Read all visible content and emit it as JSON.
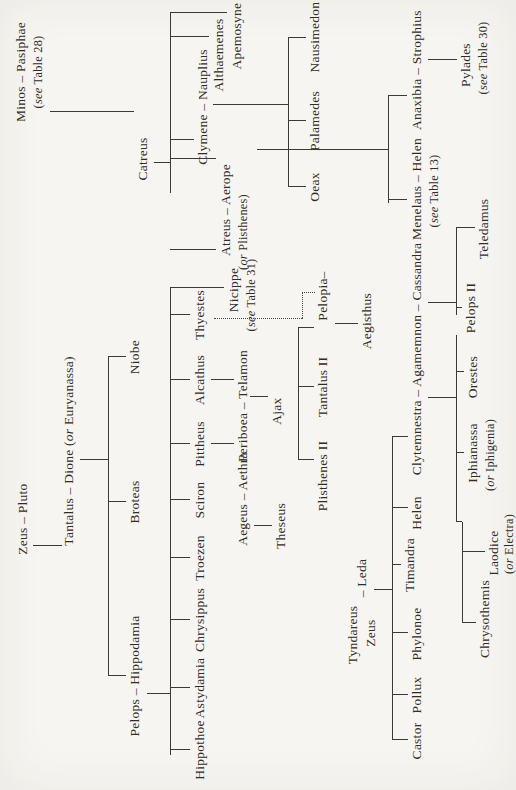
{
  "page": {
    "background": "#f6f5f1",
    "ink_color": "#2e2c29",
    "line_color": "#3b3a37"
  },
  "tree": {
    "nodes": [
      {
        "id": "zeus-pluto",
        "x": 271,
        "y": 16,
        "parts": [
          {
            "t": "Zeus – Pluto",
            "i": false
          }
        ]
      },
      {
        "id": "tantalus-dione",
        "x": 339,
        "y": 62,
        "parts": [
          {
            "t": "Tantalus – Dione (",
            "i": false
          },
          {
            "t": "or",
            "i": true
          },
          {
            "t": " Euryanassa)",
            "i": false
          }
        ]
      },
      {
        "id": "pelops-hippodamia",
        "x": 114,
        "y": 128,
        "parts": [
          {
            "t": "Pelops – Hippodamia",
            "i": false
          }
        ]
      },
      {
        "id": "broteas",
        "x": 288,
        "y": 128,
        "parts": [
          {
            "t": "Broteas",
            "i": false
          }
        ]
      },
      {
        "id": "niobe",
        "x": 433,
        "y": 128,
        "parts": [
          {
            "t": "Niobe",
            "i": false
          }
        ]
      },
      {
        "id": "hippothoe",
        "x": 40,
        "y": 193,
        "parts": [
          {
            "t": "Hippothoe",
            "i": false
          }
        ]
      },
      {
        "id": "astydamia",
        "x": 102,
        "y": 193,
        "parts": [
          {
            "t": "Astydamia",
            "i": false
          }
        ]
      },
      {
        "id": "chrysippus",
        "x": 170,
        "y": 193,
        "parts": [
          {
            "t": "Chrysippus",
            "i": false
          }
        ]
      },
      {
        "id": "troezen",
        "x": 232,
        "y": 193,
        "parts": [
          {
            "t": "Troezen",
            "i": false
          }
        ]
      },
      {
        "id": "sciron",
        "x": 290,
        "y": 193,
        "parts": [
          {
            "t": "Sciron",
            "i": false
          }
        ]
      },
      {
        "id": "pittheus",
        "x": 346,
        "y": 193,
        "parts": [
          {
            "t": "Pittheus",
            "i": false
          }
        ]
      },
      {
        "id": "alcathus",
        "x": 410,
        "y": 193,
        "parts": [
          {
            "t": "Alcathus",
            "i": false
          }
        ]
      },
      {
        "id": "thyestes",
        "x": 475,
        "y": 193,
        "parts": [
          {
            "t": "Thyestes",
            "i": false
          }
        ]
      },
      {
        "id": "aegeus-aethra",
        "x": 291,
        "y": 236,
        "parts": [
          {
            "t": "Aegeus – Aethra",
            "i": false
          }
        ]
      },
      {
        "id": "periboea-telamon",
        "x": 384,
        "y": 236,
        "parts": [
          {
            "t": "Periboea – Telamon",
            "i": false
          }
        ]
      },
      {
        "id": "theseus",
        "x": 264,
        "y": 274,
        "parts": [
          {
            "t": "Theseus",
            "i": false
          }
        ]
      },
      {
        "id": "ajax",
        "x": 379,
        "y": 270,
        "parts": [
          {
            "t": "Ajax",
            "i": false
          }
        ]
      },
      {
        "id": "plisthenes-ii",
        "x": 314,
        "y": 316,
        "parts": [
          {
            "t": "Plisthenes II",
            "i": false
          }
        ]
      },
      {
        "id": "tantalus-ii",
        "x": 403,
        "y": 316,
        "parts": [
          {
            "t": "Tantalus II",
            "i": false
          }
        ]
      },
      {
        "id": "pelopia",
        "x": 494,
        "y": 316,
        "parts": [
          {
            "t": "Pelopia–",
            "i": false
          }
        ]
      },
      {
        "id": "aegisthus",
        "x": 469,
        "y": 360,
        "parts": [
          {
            "t": "Aegisthus",
            "i": false
          }
        ]
      },
      {
        "id": "atreus-aerope",
        "x": 580,
        "y": 219,
        "parts": [
          {
            "t": "Atreus – Aerope",
            "i": false
          }
        ]
      },
      {
        "id": "atreus-aerope-note",
        "x": 558,
        "y": 237,
        "small": true,
        "parts": [
          {
            "t": "(",
            "i": false
          },
          {
            "t": "or",
            "i": true
          },
          {
            "t": " Plisthenes)",
            "i": false
          }
        ]
      },
      {
        "id": "nicippe",
        "x": 500,
        "y": 227,
        "parts": [
          {
            "t": "Nicippe",
            "i": false
          }
        ]
      },
      {
        "id": "nicippe-note",
        "x": 495,
        "y": 245,
        "small": true,
        "parts": [
          {
            "t": "(",
            "i": false
          },
          {
            "t": "see",
            "i": true
          },
          {
            "t": " Table 31)",
            "i": false
          }
        ]
      },
      {
        "id": "minos-pasiphae",
        "x": 718,
        "y": 14,
        "parts": [
          {
            "t": "Minos – Pasiphae",
            "i": false
          }
        ]
      },
      {
        "id": "minos-note",
        "x": 718,
        "y": 32,
        "small": true,
        "parts": [
          {
            "t": "(",
            "i": false
          },
          {
            "t": "see",
            "i": true
          },
          {
            "t": " Table 28)",
            "i": false
          }
        ]
      },
      {
        "id": "catreus",
        "x": 631,
        "y": 136,
        "parts": [
          {
            "t": "Catreus",
            "i": false
          }
        ]
      },
      {
        "id": "clymene-nauplius",
        "x": 683,
        "y": 196,
        "parts": [
          {
            "t": "Clymene – Nauplius",
            "i": false
          }
        ]
      },
      {
        "id": "althaemenes",
        "x": 735,
        "y": 212,
        "parts": [
          {
            "t": "Althaemenes",
            "i": false
          }
        ]
      },
      {
        "id": "apemosyne",
        "x": 754,
        "y": 230,
        "parts": [
          {
            "t": "Apemosyne",
            "i": false
          }
        ]
      },
      {
        "id": "oeax",
        "x": 603,
        "y": 308,
        "parts": [
          {
            "t": "Oeax",
            "i": false
          }
        ]
      },
      {
        "id": "palamedes",
        "x": 669,
        "y": 308,
        "parts": [
          {
            "t": "Palamedes",
            "i": false
          }
        ]
      },
      {
        "id": "nausimedon",
        "x": 753,
        "y": 308,
        "parts": [
          {
            "t": "Nausimedon",
            "i": false
          }
        ]
      },
      {
        "id": "tyndareus",
        "x": 155,
        "y": 346,
        "parts": [
          {
            "t": "Tyndareus",
            "i": false
          }
        ]
      },
      {
        "id": "zeus-2",
        "x": 157,
        "y": 364,
        "parts": [
          {
            "t": "Zeus",
            "i": false
          }
        ]
      },
      {
        "id": "leda",
        "x": 212,
        "y": 355,
        "parts": [
          {
            "t": "– Leda",
            "i": false
          }
        ]
      },
      {
        "id": "castor",
        "x": 49,
        "y": 410,
        "parts": [
          {
            "t": "Castor",
            "i": false
          }
        ]
      },
      {
        "id": "pollux",
        "x": 95,
        "y": 410,
        "parts": [
          {
            "t": "Pollux",
            "i": false
          }
        ]
      },
      {
        "id": "phylonoe",
        "x": 156,
        "y": 410,
        "parts": [
          {
            "t": "Phylonoe",
            "i": false
          }
        ]
      },
      {
        "id": "timandra",
        "x": 225,
        "y": 403,
        "parts": [
          {
            "t": "Timandra",
            "i": false
          }
        ]
      },
      {
        "id": "helen",
        "x": 277,
        "y": 410,
        "parts": [
          {
            "t": "Helen",
            "i": false
          }
        ]
      },
      {
        "id": "clytemnestra-agamemnon-cassandra",
        "x": 431,
        "y": 410,
        "parts": [
          {
            "t": "Clytemnestra – Agamemnon – Cassandra",
            "i": false
          }
        ]
      },
      {
        "id": "menelaus-helen",
        "x": 601,
        "y": 410,
        "parts": [
          {
            "t": "Menelaus – Helen",
            "i": false
          }
        ]
      },
      {
        "id": "menelaus-note",
        "x": 599,
        "y": 428,
        "small": true,
        "parts": [
          {
            "t": "(",
            "i": false
          },
          {
            "t": "see",
            "i": true
          },
          {
            "t": " Table 13)",
            "i": false
          }
        ]
      },
      {
        "id": "anaxibia-strophius",
        "x": 720,
        "y": 410,
        "parts": [
          {
            "t": "Anaxibia – Strophius",
            "i": false
          }
        ]
      },
      {
        "id": "pylades",
        "x": 725,
        "y": 459,
        "parts": [
          {
            "t": "Pylades",
            "i": false
          }
        ]
      },
      {
        "id": "pylades-note",
        "x": 732,
        "y": 477,
        "small": true,
        "parts": [
          {
            "t": "(",
            "i": false
          },
          {
            "t": "see",
            "i": true
          },
          {
            "t": " Table 30)",
            "i": false
          }
        ]
      },
      {
        "id": "orestes",
        "x": 413,
        "y": 466,
        "parts": [
          {
            "t": "Orestes",
            "i": false
          }
        ]
      },
      {
        "id": "iphianassa",
        "x": 337,
        "y": 466,
        "parts": [
          {
            "t": "Iphianassa",
            "i": false
          }
        ]
      },
      {
        "id": "iphianassa-note",
        "x": 335,
        "y": 484,
        "small": true,
        "parts": [
          {
            "t": "(",
            "i": false
          },
          {
            "t": "or",
            "i": true
          },
          {
            "t": " Iphigenia)",
            "i": false
          }
        ]
      },
      {
        "id": "laodice",
        "x": 237,
        "y": 487,
        "parts": [
          {
            "t": "Laodice",
            "i": false
          }
        ]
      },
      {
        "id": "laodice-note",
        "x": 246,
        "y": 503,
        "small": true,
        "parts": [
          {
            "t": "(",
            "i": false
          },
          {
            "t": "or",
            "i": true
          },
          {
            "t": " Electra)",
            "i": false
          }
        ]
      },
      {
        "id": "chrysothemis",
        "x": 171,
        "y": 478,
        "parts": [
          {
            "t": "Chrysothemis",
            "i": false
          }
        ]
      },
      {
        "id": "pelops-ii",
        "x": 482,
        "y": 464,
        "parts": [
          {
            "t": "Pelops II",
            "i": false
          }
        ]
      },
      {
        "id": "teledamus",
        "x": 561,
        "y": 477,
        "parts": [
          {
            "t": "Teledamus",
            "i": false
          }
        ]
      }
    ],
    "edges": [
      {
        "x1": 244,
        "y1": 33,
        "x2": 244,
        "y2": 62
      },
      {
        "x1": 330,
        "y1": 80,
        "x2": 330,
        "y2": 108
      },
      {
        "x1": 114,
        "y1": 108,
        "x2": 433,
        "y2": 108
      },
      {
        "x1": 114,
        "y1": 108,
        "x2": 114,
        "y2": 126
      },
      {
        "x1": 288,
        "y1": 108,
        "x2": 288,
        "y2": 126
      },
      {
        "x1": 433,
        "y1": 108,
        "x2": 433,
        "y2": 126
      },
      {
        "x1": 96,
        "y1": 147,
        "x2": 96,
        "y2": 170
      },
      {
        "x1": 35,
        "y1": 170,
        "x2": 502,
        "y2": 170
      },
      {
        "x1": 40,
        "y1": 170,
        "x2": 40,
        "y2": 190
      },
      {
        "x1": 102,
        "y1": 170,
        "x2": 102,
        "y2": 190
      },
      {
        "x1": 170,
        "y1": 170,
        "x2": 170,
        "y2": 190
      },
      {
        "x1": 232,
        "y1": 170,
        "x2": 232,
        "y2": 190
      },
      {
        "x1": 290,
        "y1": 170,
        "x2": 290,
        "y2": 190
      },
      {
        "x1": 346,
        "y1": 170,
        "x2": 346,
        "y2": 190
      },
      {
        "x1": 410,
        "y1": 170,
        "x2": 410,
        "y2": 190
      },
      {
        "x1": 475,
        "y1": 170,
        "x2": 475,
        "y2": 190
      },
      {
        "x1": 502,
        "y1": 170,
        "x2": 502,
        "y2": 224
      },
      {
        "x1": 540,
        "y1": 170,
        "x2": 540,
        "y2": 216
      },
      {
        "x1": 346,
        "y1": 211,
        "x2": 346,
        "y2": 234
      },
      {
        "x1": 410,
        "y1": 211,
        "x2": 410,
        "y2": 234
      },
      {
        "x1": 264,
        "y1": 254,
        "x2": 264,
        "y2": 272
      },
      {
        "x1": 393,
        "y1": 250,
        "x2": 393,
        "y2": 268
      },
      {
        "x1": 330,
        "y1": 298,
        "x2": 462,
        "y2": 298
      },
      {
        "x1": 330,
        "y1": 298,
        "x2": 330,
        "y2": 314
      },
      {
        "x1": 403,
        "y1": 298,
        "x2": 403,
        "y2": 314
      },
      {
        "x1": 462,
        "y1": 298,
        "x2": 462,
        "y2": 314
      },
      {
        "x1": 471,
        "y1": 214,
        "x2": 471,
        "y2": 302,
        "dotted": true
      },
      {
        "x1": 471,
        "y1": 302,
        "x2": 497,
        "y2": 302,
        "dotted": true
      },
      {
        "x1": 497,
        "y1": 302,
        "x2": 497,
        "y2": 315,
        "dotted": true
      },
      {
        "x1": 466,
        "y1": 335,
        "x2": 466,
        "y2": 358
      },
      {
        "x1": 678,
        "y1": 50,
        "x2": 678,
        "y2": 134
      },
      {
        "x1": 627,
        "y1": 154,
        "x2": 627,
        "y2": 170
      },
      {
        "x1": 597,
        "y1": 170,
        "x2": 777,
        "y2": 170
      },
      {
        "x1": 631,
        "y1": 170,
        "x2": 631,
        "y2": 216
      },
      {
        "x1": 650,
        "y1": 170,
        "x2": 650,
        "y2": 194
      },
      {
        "x1": 753,
        "y1": 170,
        "x2": 753,
        "y2": 209
      },
      {
        "x1": 777,
        "y1": 170,
        "x2": 777,
        "y2": 227
      },
      {
        "x1": 685,
        "y1": 213,
        "x2": 685,
        "y2": 288
      },
      {
        "x1": 603,
        "y1": 288,
        "x2": 752,
        "y2": 288
      },
      {
        "x1": 603,
        "y1": 288,
        "x2": 603,
        "y2": 306
      },
      {
        "x1": 669,
        "y1": 288,
        "x2": 669,
        "y2": 306
      },
      {
        "x1": 752,
        "y1": 288,
        "x2": 752,
        "y2": 306
      },
      {
        "x1": 640,
        "y1": 257,
        "x2": 640,
        "y2": 388
      },
      {
        "x1": 587,
        "y1": 388,
        "x2": 694,
        "y2": 388
      },
      {
        "x1": 590,
        "y1": 388,
        "x2": 590,
        "y2": 407
      },
      {
        "x1": 694,
        "y1": 388,
        "x2": 694,
        "y2": 407
      },
      {
        "x1": 730,
        "y1": 428,
        "x2": 730,
        "y2": 457
      },
      {
        "x1": 200,
        "y1": 374,
        "x2": 200,
        "y2": 392
      },
      {
        "x1": 50,
        "y1": 392,
        "x2": 353,
        "y2": 392
      },
      {
        "x1": 50,
        "y1": 392,
        "x2": 50,
        "y2": 408
      },
      {
        "x1": 95,
        "y1": 392,
        "x2": 95,
        "y2": 408
      },
      {
        "x1": 157,
        "y1": 392,
        "x2": 157,
        "y2": 408
      },
      {
        "x1": 225,
        "y1": 392,
        "x2": 225,
        "y2": 401
      },
      {
        "x1": 282,
        "y1": 392,
        "x2": 282,
        "y2": 408
      },
      {
        "x1": 353,
        "y1": 392,
        "x2": 353,
        "y2": 408
      },
      {
        "x1": 392,
        "y1": 428,
        "x2": 392,
        "y2": 456
      },
      {
        "x1": 268,
        "y1": 456,
        "x2": 455,
        "y2": 456
      },
      {
        "x1": 418,
        "y1": 456,
        "x2": 418,
        "y2": 464
      },
      {
        "x1": 337,
        "y1": 456,
        "x2": 337,
        "y2": 464
      },
      {
        "x1": 268,
        "y1": 456,
        "x2": 268,
        "y2": 462
      },
      {
        "x1": 167,
        "y1": 462,
        "x2": 268,
        "y2": 462
      },
      {
        "x1": 238,
        "y1": 462,
        "x2": 238,
        "y2": 485
      },
      {
        "x1": 167,
        "y1": 462,
        "x2": 167,
        "y2": 476
      },
      {
        "x1": 487,
        "y1": 428,
        "x2": 487,
        "y2": 456
      },
      {
        "x1": 475,
        "y1": 456,
        "x2": 562,
        "y2": 456
      },
      {
        "x1": 482,
        "y1": 456,
        "x2": 482,
        "y2": 462
      },
      {
        "x1": 562,
        "y1": 456,
        "x2": 562,
        "y2": 475
      }
    ]
  }
}
